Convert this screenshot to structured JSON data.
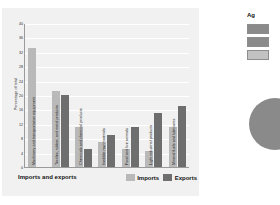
{
  "chart_data": {
    "type": "bar",
    "title": "",
    "xlabel": "Imports and exports",
    "ylabel": "Percentage of total",
    "ylim": [
      0,
      40
    ],
    "grid": true,
    "legend_position": "bottom-right",
    "categories": [
      "Machinery and transportation equipment",
      "Textiles, rubber, and metal products",
      "Chemicals and chemical products",
      "Inedible raw materials",
      "Food and live animals",
      "Light industrial products",
      "Mineral fuels and lubricants"
    ],
    "series": [
      {
        "name": "Imports",
        "color": "#b9b9b9",
        "values": [
          33,
          21,
          11,
          7,
          5,
          4.5,
          11
        ]
      },
      {
        "name": "Exports",
        "color": "#6e6e6e",
        "values": [
          0,
          20,
          5,
          9,
          11,
          15,
          17
        ]
      }
    ],
    "yticks": [
      0,
      4,
      8,
      12,
      16,
      20,
      24,
      28,
      32,
      36,
      40
    ],
    "ytick_labels": [
      "0",
      "4",
      "8",
      "12",
      "16",
      "20",
      "24",
      "28",
      "32",
      "36",
      "40"
    ]
  },
  "axis": {
    "y_title": "Percentage of total",
    "x_title": "Imports and exports"
  },
  "legend": {
    "items": [
      {
        "label": "Imports",
        "color": "#b9b9b9"
      },
      {
        "label": "Exports",
        "color": "#6e6e6e"
      }
    ]
  },
  "side_panel": {
    "title": "Ag",
    "swatches": [
      {
        "color": "#8a8a8a"
      },
      {
        "color": "#8a8a8a"
      },
      {
        "color": "#c2c2c2"
      }
    ]
  }
}
